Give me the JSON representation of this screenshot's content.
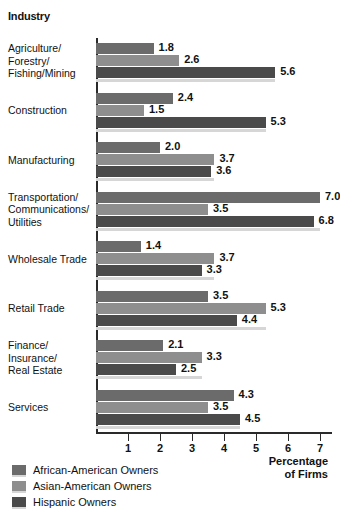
{
  "header": {
    "industry_label": "Industry"
  },
  "axis": {
    "x_title_line1": "Percentage",
    "x_title_line2": "of Firms",
    "ticks": [
      "1",
      "2",
      "3",
      "4",
      "5",
      "6",
      "7"
    ]
  },
  "legend": {
    "items": [
      {
        "label": "African-American Owners",
        "color": "#6b6b6b"
      },
      {
        "label": "Asian-American Owners",
        "color": "#8e8e8e"
      },
      {
        "label": "Hispanic Owners",
        "color": "#4a4a4a"
      }
    ]
  },
  "chart_data": {
    "type": "bar",
    "orientation": "horizontal",
    "title": "",
    "xlabel": "Percentage of Firms",
    "ylabel": "Industry",
    "xlim": [
      0,
      7.4
    ],
    "grid": false,
    "legend_position": "bottom-left",
    "categories": [
      "Agriculture/\nForestry/\nFishing/Mining",
      "Construction",
      "Manufacturing",
      "Transportation/\nCommunications/\nUtilities",
      "Wholesale Trade",
      "Retail Trade",
      "Finance/\nInsurance/\nReal Estate",
      "Services"
    ],
    "category_lines": [
      [
        "Agriculture/",
        "Forestry/",
        "Fishing/Mining"
      ],
      [
        "Construction"
      ],
      [
        "Manufacturing"
      ],
      [
        "Transportation/",
        "Communications/",
        "Utilities"
      ],
      [
        "Wholesale Trade"
      ],
      [
        "Retail Trade"
      ],
      [
        "Finance/",
        "Insurance/",
        "Real Estate"
      ],
      [
        "Services"
      ]
    ],
    "series": [
      {
        "name": "African-American Owners",
        "color": "#6b6b6b",
        "values": [
          1.8,
          2.4,
          2.0,
          7.0,
          1.4,
          3.5,
          2.1,
          4.3
        ]
      },
      {
        "name": "Asian-American Owners",
        "color": "#8e8e8e",
        "values": [
          2.6,
          1.5,
          3.7,
          3.5,
          3.7,
          5.3,
          3.3,
          3.5
        ]
      },
      {
        "name": "Hispanic Owners",
        "color": "#4a4a4a",
        "values": [
          5.6,
          5.3,
          3.6,
          6.8,
          3.3,
          4.4,
          2.5,
          4.5
        ]
      }
    ]
  }
}
